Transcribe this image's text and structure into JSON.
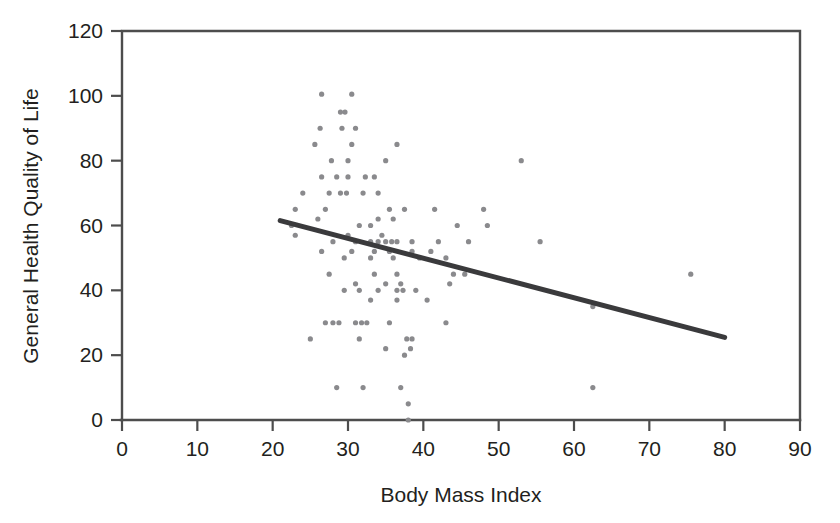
{
  "chart_data": {
    "type": "scatter",
    "title": "",
    "xlabel": "Body Mass Index",
    "ylabel": "General Health Quality of Life",
    "xlim": [
      0,
      90
    ],
    "ylim": [
      0,
      120
    ],
    "xticks": [
      0,
      10,
      20,
      30,
      40,
      50,
      60,
      70,
      80,
      90
    ],
    "yticks": [
      0,
      20,
      40,
      60,
      80,
      100,
      120
    ],
    "grid": false,
    "legend": null,
    "marker_color": "#8a8a8d",
    "line_color": "#3a3a3c",
    "axis_color": "#4d4d4d",
    "background_color": "#ffffff",
    "trendline": {
      "label": "linear fit",
      "x_start": 21.0,
      "y_start": 61.5,
      "x_end": 80.0,
      "y_end": 25.5,
      "slope": -0.61,
      "intercept": 74.3
    },
    "points": [
      [
        26.5,
        100.5
      ],
      [
        30.5,
        100.5
      ],
      [
        29.0,
        95.0
      ],
      [
        29.6,
        95.0
      ],
      [
        26.3,
        90.0
      ],
      [
        29.2,
        90.0
      ],
      [
        31.0,
        90.0
      ],
      [
        25.6,
        85.0
      ],
      [
        30.5,
        85.0
      ],
      [
        36.5,
        85.0
      ],
      [
        27.8,
        80.0
      ],
      [
        30.0,
        80.0
      ],
      [
        35.0,
        80.0
      ],
      [
        53.0,
        80.0
      ],
      [
        28.5,
        75.0
      ],
      [
        30.0,
        75.0
      ],
      [
        32.3,
        75.0
      ],
      [
        26.5,
        75.0
      ],
      [
        33.5,
        75.0
      ],
      [
        24.0,
        70.0
      ],
      [
        27.5,
        70.0
      ],
      [
        29.0,
        70.0
      ],
      [
        29.8,
        70.0
      ],
      [
        32.0,
        70.0
      ],
      [
        34.0,
        70.0
      ],
      [
        23.0,
        65.0
      ],
      [
        27.0,
        65.0
      ],
      [
        35.5,
        65.0
      ],
      [
        37.5,
        65.0
      ],
      [
        41.5,
        65.0
      ],
      [
        48.0,
        65.0
      ],
      [
        26.0,
        62.0
      ],
      [
        34.0,
        62.0
      ],
      [
        36.0,
        62.0
      ],
      [
        22.5,
        60.0
      ],
      [
        31.5,
        60.0
      ],
      [
        33.0,
        60.0
      ],
      [
        44.5,
        60.0
      ],
      [
        48.5,
        60.0
      ],
      [
        23.0,
        57.0
      ],
      [
        30.0,
        57.0
      ],
      [
        34.5,
        57.0
      ],
      [
        28.0,
        55.0
      ],
      [
        31.0,
        55.0
      ],
      [
        33.0,
        55.0
      ],
      [
        34.0,
        55.0
      ],
      [
        35.0,
        55.0
      ],
      [
        35.8,
        55.0
      ],
      [
        36.5,
        55.0
      ],
      [
        38.5,
        55.0
      ],
      [
        42.0,
        55.0
      ],
      [
        46.0,
        55.0
      ],
      [
        55.5,
        55.0
      ],
      [
        26.5,
        52.0
      ],
      [
        30.5,
        52.0
      ],
      [
        33.5,
        52.0
      ],
      [
        35.5,
        52.0
      ],
      [
        38.5,
        52.0
      ],
      [
        41.0,
        52.0
      ],
      [
        29.5,
        50.0
      ],
      [
        33.0,
        50.0
      ],
      [
        36.0,
        50.0
      ],
      [
        39.5,
        50.0
      ],
      [
        43.0,
        50.0
      ],
      [
        27.5,
        45.0
      ],
      [
        33.5,
        45.0
      ],
      [
        36.5,
        45.0
      ],
      [
        44.0,
        45.0
      ],
      [
        45.5,
        45.0
      ],
      [
        75.5,
        45.0
      ],
      [
        31.0,
        42.0
      ],
      [
        35.0,
        42.0
      ],
      [
        37.0,
        42.0
      ],
      [
        43.5,
        42.0
      ],
      [
        29.5,
        40.0
      ],
      [
        31.5,
        40.0
      ],
      [
        34.0,
        40.0
      ],
      [
        36.5,
        40.0
      ],
      [
        37.3,
        40.0
      ],
      [
        39.0,
        40.0
      ],
      [
        33.0,
        37.0
      ],
      [
        36.5,
        37.0
      ],
      [
        40.5,
        37.0
      ],
      [
        62.5,
        35.0
      ],
      [
        27.0,
        30.0
      ],
      [
        28.0,
        30.0
      ],
      [
        28.8,
        30.0
      ],
      [
        31.0,
        30.0
      ],
      [
        31.8,
        30.0
      ],
      [
        32.5,
        30.0
      ],
      [
        35.5,
        30.0
      ],
      [
        43.0,
        30.0
      ],
      [
        25.0,
        25.0
      ],
      [
        31.5,
        25.0
      ],
      [
        37.8,
        25.0
      ],
      [
        38.5,
        25.0
      ],
      [
        35.0,
        22.0
      ],
      [
        38.3,
        22.0
      ],
      [
        37.5,
        20.0
      ],
      [
        28.5,
        10.0
      ],
      [
        32.0,
        10.0
      ],
      [
        37.0,
        10.0
      ],
      [
        62.5,
        10.0
      ],
      [
        38.0,
        5.0
      ],
      [
        38.0,
        0.0
      ]
    ]
  },
  "axes": {
    "x_tick_labels": [
      "0",
      "10",
      "20",
      "30",
      "40",
      "50",
      "60",
      "70",
      "80",
      "90"
    ],
    "y_tick_labels": [
      "0",
      "20",
      "40",
      "60",
      "80",
      "100",
      "120"
    ],
    "x_axis_title": "Body Mass Index",
    "y_axis_title": "General Health Quality of Life"
  }
}
